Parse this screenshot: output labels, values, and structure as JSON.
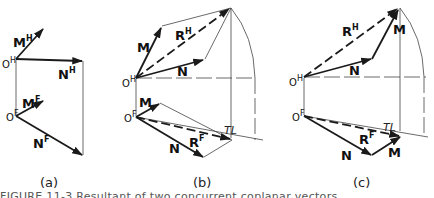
{
  "figure": {
    "caption": "FIGURE 11-3  Resultant of two concurrent coplanar vectors",
    "colors": {
      "ink": "#1a1a1a",
      "construction": "#444444",
      "background": "#ffffff"
    },
    "panels": [
      {
        "id": "a",
        "label": "(a)",
        "origin_top": {
          "name": "O",
          "sup": "H"
        },
        "origin_bottom": {
          "name": "O",
          "sup": "F"
        },
        "vectors_top": [
          {
            "name": "M",
            "sup": "H"
          },
          {
            "name": "N",
            "sup": "H"
          }
        ],
        "vectors_bottom": [
          {
            "name": "M",
            "sup": "F"
          },
          {
            "name": "N",
            "sup": "F"
          }
        ]
      },
      {
        "id": "b",
        "label": "(b)",
        "origin_top": {
          "name": "O",
          "sup": "H"
        },
        "origin_bottom": {
          "name": "O",
          "sup": "F"
        },
        "vectors_top": [
          {
            "name": "M",
            "sup": ""
          },
          {
            "name": "N",
            "sup": ""
          }
        ],
        "vectors_bottom": [
          {
            "name": "M",
            "sup": ""
          },
          {
            "name": "N",
            "sup": ""
          }
        ],
        "resultant_top": {
          "name": "R",
          "sup": "H"
        },
        "resultant_bottom": {
          "name": "R",
          "sup": "F"
        },
        "true_length": "TL"
      },
      {
        "id": "c",
        "label": "(c)",
        "origin_top": {
          "name": "O",
          "sup": "H"
        },
        "origin_bottom": {
          "name": "O",
          "sup": "F"
        },
        "vectors_top": [
          {
            "name": "M",
            "sup": ""
          },
          {
            "name": "N",
            "sup": ""
          }
        ],
        "vectors_bottom": [
          {
            "name": "M",
            "sup": ""
          },
          {
            "name": "N",
            "sup": ""
          }
        ],
        "resultant_top": {
          "name": "R",
          "sup": "H"
        },
        "resultant_bottom": {
          "name": "R",
          "sup": "F"
        },
        "true_length": "TL"
      }
    ]
  }
}
